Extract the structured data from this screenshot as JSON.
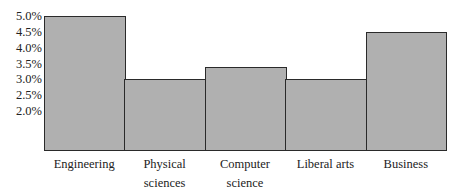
{
  "chart_data": {
    "type": "bar",
    "title": "",
    "xlabel": "",
    "ylabel": "",
    "categories": [
      "Engineering",
      "Physical sciences",
      "Computer science",
      "Liberal arts",
      "Business"
    ],
    "category_lines": [
      [
        "Engineering"
      ],
      [
        "Physical",
        "sciences"
      ],
      [
        "Computer",
        "science"
      ],
      [
        "Liberal arts"
      ],
      [
        "Business"
      ]
    ],
    "values": [
      5.0,
      3.0,
      3.4,
      3.0,
      4.5
    ],
    "value_unit": "%",
    "yticks": [
      "5.0%",
      "4.5%",
      "4.0%",
      "3.5%",
      "3.0%",
      "2.5%",
      "2.0%"
    ],
    "ytick_values": [
      5.0,
      4.5,
      4.0,
      3.5,
      3.0,
      2.5,
      2.0
    ],
    "ylim": [
      0.75,
      5.0
    ],
    "grid": false,
    "legend": null,
    "bar_color": "#b0b0b0",
    "edge_color": "#2a2a2a"
  }
}
